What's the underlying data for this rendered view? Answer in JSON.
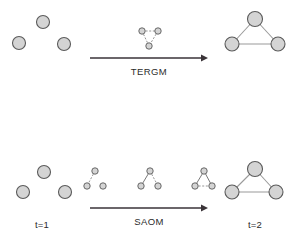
{
  "figure": {
    "title_visible": false,
    "background_color": "#ffffff",
    "node_fill_color": "#d4d4d4",
    "node_stroke_color": "#5a5a5a",
    "edge_solid_color": "#9a9a9a",
    "edge_dashed_color": "#8a8a8a",
    "arrow_color": "#3a3338",
    "text_color": "#2b2b2b"
  },
  "rows": [
    {
      "id": "tergm-row",
      "model_label": "TERGM",
      "arrow": {
        "x1": 90,
        "y1": 58,
        "x2": 208,
        "y2": 58
      },
      "panels": [
        {
          "id": "tergm-start-network",
          "kind": "big-network",
          "cx": 48,
          "cy": 32,
          "nodes": [
            {
              "id": "a",
              "x": 43,
              "y": 22,
              "r": 6.5
            },
            {
              "id": "b",
              "x": 19,
              "y": 43,
              "r": 6.5
            },
            {
              "id": "c",
              "x": 64,
              "y": 44,
              "r": 6.5
            }
          ],
          "edges": []
        },
        {
          "id": "tergm-intermediate-network",
          "kind": "small-network",
          "cx": 150,
          "cy": 35,
          "nodes": [
            {
              "id": "a",
              "x": 142,
              "y": 31,
              "r": 3.2
            },
            {
              "id": "b",
              "x": 158,
              "y": 31,
              "r": 3.2
            },
            {
              "id": "c",
              "x": 149,
              "y": 46,
              "r": 3.2
            }
          ],
          "edges": [
            {
              "from": "a",
              "to": "b",
              "style": "dashed"
            },
            {
              "from": "a",
              "to": "c",
              "style": "dashed"
            },
            {
              "from": "b",
              "to": "c",
              "style": "dashed"
            }
          ]
        },
        {
          "id": "tergm-end-network",
          "kind": "big-network",
          "cx": 255,
          "cy": 32,
          "nodes": [
            {
              "id": "a",
              "x": 255,
              "y": 19,
              "r": 7.5
            },
            {
              "id": "b",
              "x": 232,
              "y": 44,
              "r": 7.0
            },
            {
              "id": "c",
              "x": 278,
              "y": 44,
              "r": 7.0
            }
          ],
          "edges": [
            {
              "from": "a",
              "to": "b",
              "style": "solid"
            },
            {
              "from": "a",
              "to": "c",
              "style": "solid"
            },
            {
              "from": "b",
              "to": "c",
              "style": "solid"
            }
          ]
        }
      ]
    },
    {
      "id": "saom-row",
      "model_label": "SAOM",
      "start_time_label": "t=1",
      "end_time_label": "t=2",
      "arrow": {
        "x1": 90,
        "y1": 208,
        "x2": 208,
        "y2": 208
      },
      "panels": [
        {
          "id": "saom-start-network",
          "kind": "big-network",
          "cx": 48,
          "cy": 180,
          "nodes": [
            {
              "id": "a",
              "x": 44,
              "y": 172,
              "r": 6.5
            },
            {
              "id": "b",
              "x": 23,
              "y": 192,
              "r": 6.5
            },
            {
              "id": "c",
              "x": 65,
              "y": 192,
              "r": 6.5
            }
          ],
          "edges": []
        },
        {
          "id": "saom-step-1-network",
          "kind": "small-network",
          "cx": 96,
          "cy": 181,
          "nodes": [
            {
              "id": "a",
              "x": 95,
              "y": 171,
              "r": 3.2
            },
            {
              "id": "b",
              "x": 87,
              "y": 186,
              "r": 3.2
            },
            {
              "id": "c",
              "x": 103,
              "y": 186,
              "r": 3.2
            }
          ],
          "edges": [
            {
              "from": "a",
              "to": "b",
              "style": "dashed"
            }
          ]
        },
        {
          "id": "saom-step-2-network",
          "kind": "small-network",
          "cx": 150,
          "cy": 181,
          "nodes": [
            {
              "id": "a",
              "x": 150,
              "y": 171,
              "r": 3.2
            },
            {
              "id": "b",
              "x": 141,
              "y": 186,
              "r": 3.2
            },
            {
              "id": "c",
              "x": 158,
              "y": 186,
              "r": 3.2
            }
          ],
          "edges": [
            {
              "from": "a",
              "to": "b",
              "style": "solid"
            },
            {
              "from": "a",
              "to": "c",
              "style": "dashed"
            }
          ]
        },
        {
          "id": "saom-step-3-network",
          "kind": "small-network",
          "cx": 204,
          "cy": 181,
          "nodes": [
            {
              "id": "a",
              "x": 204,
              "y": 171,
              "r": 3.2
            },
            {
              "id": "b",
              "x": 195,
              "y": 186,
              "r": 3.2
            },
            {
              "id": "c",
              "x": 212,
              "y": 186,
              "r": 3.2
            }
          ],
          "edges": [
            {
              "from": "a",
              "to": "b",
              "style": "solid"
            },
            {
              "from": "a",
              "to": "c",
              "style": "solid"
            },
            {
              "from": "b",
              "to": "c",
              "style": "dashed"
            }
          ]
        },
        {
          "id": "saom-end-network",
          "kind": "big-network",
          "cx": 255,
          "cy": 180,
          "nodes": [
            {
              "id": "a",
              "x": 255,
              "y": 169,
              "r": 7.5
            },
            {
              "id": "b",
              "x": 232,
              "y": 192,
              "r": 7.0
            },
            {
              "id": "c",
              "x": 276,
              "y": 192,
              "r": 7.0
            }
          ],
          "edges": [
            {
              "from": "a",
              "to": "b",
              "style": "solid"
            },
            {
              "from": "a",
              "to": "c",
              "style": "solid"
            },
            {
              "from": "b",
              "to": "c",
              "style": "solid"
            }
          ]
        }
      ]
    }
  ],
  "labels": {
    "tergm": {
      "text": "TERGM",
      "x": 149,
      "y": 75
    },
    "saom": {
      "text": "SAOM",
      "x": 149,
      "y": 225
    },
    "t1": {
      "text": "t=1",
      "x": 42,
      "y": 228
    },
    "t2": {
      "text": "t=2",
      "x": 255,
      "y": 228
    }
  }
}
